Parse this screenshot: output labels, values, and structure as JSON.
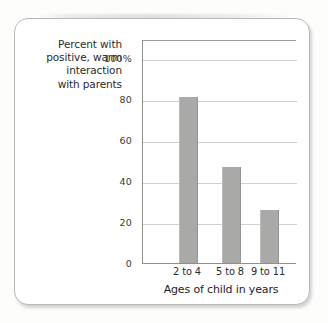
{
  "figure": {
    "y_axis_caption_lines": [
      "Percent with",
      "positive, warm",
      "interaction",
      "with parents"
    ]
  },
  "chart_data": {
    "type": "bar",
    "title": "",
    "subtitle": "",
    "xlabel": "Ages of child in years",
    "ylabel": "Percent with positive, warm interaction with parents",
    "categories": [
      "2 to 4",
      "5 to 8",
      "9 to 11"
    ],
    "values": [
      81,
      47,
      26
    ],
    "ylim": [
      0,
      100
    ],
    "ytick_labels": [
      "0",
      "20",
      "40",
      "60",
      "80",
      "100%"
    ],
    "ytick_values": [
      0,
      20,
      40,
      60,
      80,
      100
    ],
    "grid": true,
    "legend": "none",
    "bar_color": "#a9a9a7",
    "gridline_color": "#cfcfcd",
    "axis_color": "#8f8f8d"
  }
}
